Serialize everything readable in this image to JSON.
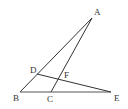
{
  "diagram": {
    "type": "geometry",
    "points": {
      "A": {
        "label": "A",
        "x": 92,
        "y": 18,
        "lx": 94,
        "ly": 15
      },
      "B": {
        "label": "B",
        "x": 20,
        "y": 92,
        "lx": 13,
        "ly": 101
      },
      "C": {
        "label": "C",
        "x": 51,
        "y": 92,
        "lx": 47,
        "ly": 102
      },
      "D": {
        "label": "D",
        "x": 37,
        "y": 74,
        "lx": 30,
        "ly": 73
      },
      "E": {
        "label": "E",
        "x": 111,
        "y": 92,
        "lx": 114,
        "ly": 101
      },
      "F": {
        "label": "F",
        "x": 58,
        "y": 79,
        "lx": 64,
        "ly": 78
      }
    },
    "segments": [
      {
        "from": "A",
        "to": "B"
      },
      {
        "from": "A",
        "to": "C"
      },
      {
        "from": "B",
        "to": "E"
      },
      {
        "from": "D",
        "to": "E"
      }
    ],
    "stroke_color": "#333333"
  }
}
